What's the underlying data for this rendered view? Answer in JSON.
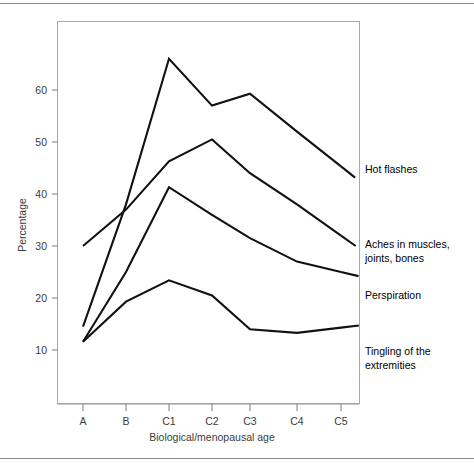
{
  "figure": {
    "y_axis_title": "Percentage",
    "x_axis_title": "Biological/menopausal age"
  },
  "axis": {
    "y_ticks": [
      "60",
      "50",
      "40",
      "30",
      "20",
      "10"
    ],
    "x_ticks": [
      "A",
      "B",
      "C1",
      "C2",
      "C3",
      "C4",
      "C5"
    ]
  },
  "labels": {
    "hot_flashes": "Hot flashes",
    "aches_line1": "Aches in muscles,",
    "aches_line2": "joints, bones",
    "perspiration": "Perspiration",
    "tingling_line1": "Tingling of the",
    "tingling_line2": "extremities"
  },
  "colors": {
    "line": "#111111",
    "axis": "#9a9a9a",
    "text": "#3b3b3b",
    "background": "#ffffff",
    "rule": "#8a8a8a"
  },
  "chart_data": {
    "type": "line",
    "title": "",
    "xlabel": "Biological/menopausal age",
    "ylabel": "Percentage",
    "categories": [
      "A",
      "B",
      "C1",
      "C2",
      "C3",
      "C4",
      "C5"
    ],
    "ylim": [
      6,
      70
    ],
    "yticks": [
      10,
      20,
      30,
      40,
      50,
      60
    ],
    "grid": false,
    "legend": "right-of-line-ends",
    "series": [
      {
        "name": "Hot flashes",
        "values": [
          14.5,
          38.0,
          66.0,
          57.0,
          59.3,
          52.0,
          45.3
        ]
      },
      {
        "name": "Aches in muscles, joints, bones",
        "values": [
          30.0,
          37.0,
          46.3,
          50.5,
          44.0,
          38.0,
          32.0
        ]
      },
      {
        "name": "Perspiration",
        "values": [
          11.6,
          25.0,
          41.3,
          36.0,
          31.5,
          27.0,
          25.0
        ]
      },
      {
        "name": "Tingling of the extremities",
        "values": [
          11.6,
          19.3,
          23.4,
          20.5,
          14.0,
          13.3,
          14.3
        ]
      }
    ]
  }
}
